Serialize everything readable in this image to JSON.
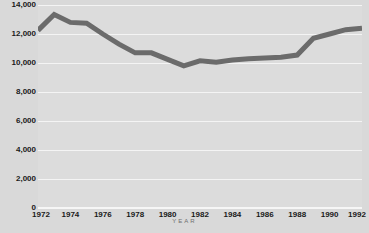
{
  "chart_data": {
    "type": "line",
    "title": "",
    "xlabel": "YEAR",
    "ylabel": "",
    "x": [
      1972,
      1973,
      1974,
      1975,
      1976,
      1977,
      1978,
      1979,
      1980,
      1981,
      1982,
      1983,
      1984,
      1985,
      1986,
      1987,
      1988,
      1989,
      1990,
      1991,
      1992
    ],
    "values": [
      12250,
      13350,
      12800,
      12750,
      12000,
      11300,
      10700,
      10700,
      10250,
      9800,
      10150,
      10050,
      10200,
      10300,
      10350,
      10400,
      10550,
      11700,
      12000,
      12300,
      12400
    ],
    "series": [
      {
        "name": "",
        "values": [
          12250,
          13350,
          12800,
          12750,
          12000,
          11300,
          10700,
          10700,
          10250,
          9800,
          10150,
          10050,
          10200,
          10300,
          10350,
          10400,
          10550,
          11700,
          12000,
          12300,
          12400
        ]
      }
    ],
    "categories": [
      "1972",
      "1973",
      "1974",
      "1975",
      "1976",
      "1977",
      "1978",
      "1979",
      "1980",
      "1981",
      "1982",
      "1983",
      "1984",
      "1985",
      "1986",
      "1987",
      "1988",
      "1989",
      "1990",
      "1991",
      "1992"
    ],
    "y_ticks": [
      0,
      2000,
      4000,
      6000,
      8000,
      10000,
      12000,
      14000
    ],
    "y_tick_labels": [
      "0",
      "2,000",
      "4,000",
      "6,000",
      "8,000",
      "10,000",
      "12,000",
      "14,000"
    ],
    "x_ticks": [
      1972,
      1974,
      1976,
      1978,
      1980,
      1982,
      1984,
      1986,
      1988,
      1990,
      1992
    ],
    "x_tick_labels": [
      "1972",
      "1974",
      "1976",
      "1978",
      "1980",
      "1982",
      "1984",
      "1986",
      "1988",
      "1990",
      "1992"
    ],
    "ylim": [
      0,
      14000
    ],
    "xlim": [
      1972,
      1992
    ],
    "grid": true,
    "legend": "none",
    "colors": {
      "line": "#6b6b6b",
      "plot_background": "#dcdcdc",
      "page_background": "#d9d9d9",
      "gridline": "#f4f4f4",
      "tick_text": "#1a1a1a",
      "axis_title_text": "#6e6e6e"
    },
    "line_width_px": 5
  }
}
